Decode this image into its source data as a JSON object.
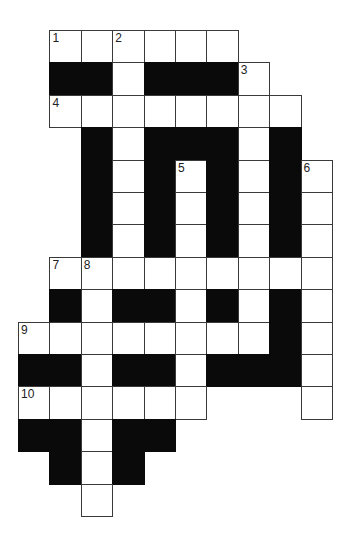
{
  "puzzle": {
    "type": "crossword",
    "origin": {
      "x": 18,
      "y": 30
    },
    "cell_w": 31.4,
    "cell_h": 32.4,
    "colors": {
      "white": "#ffffff",
      "black": "#0a0a0a",
      "border": "#3a3a3a"
    },
    "rows": [
      ".WWWWWW...",
      ".##W###W..",
      ".WWWWWWWW.",
      "..#W###W#.",
      "..#W#W#W#W",
      "..#W#W#W#W",
      "..#W#W#W#W",
      ".WWWWWWWWW",
      ".#W##W#W#W",
      "WWWWWWWW#W",
      "##W##W###W",
      "WWWWWW...W",
      "##W##.....",
      ".#W#......",
      "..W......."
    ],
    "numbers": [
      {
        "label": "1",
        "row": 0,
        "col": 1
      },
      {
        "label": "2",
        "row": 0,
        "col": 3
      },
      {
        "label": "3",
        "row": 1,
        "col": 7
      },
      {
        "label": "4",
        "row": 2,
        "col": 1
      },
      {
        "label": "5",
        "row": 4,
        "col": 5
      },
      {
        "label": "6",
        "row": 4,
        "col": 9
      },
      {
        "label": "7",
        "row": 7,
        "col": 1
      },
      {
        "label": "8",
        "row": 7,
        "col": 2
      },
      {
        "label": "9",
        "row": 9,
        "col": 0
      },
      {
        "label": "10",
        "row": 11,
        "col": 0
      }
    ]
  }
}
